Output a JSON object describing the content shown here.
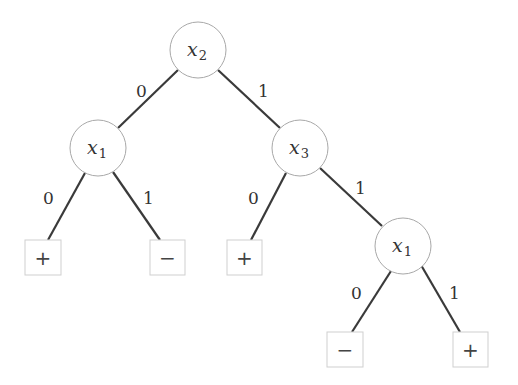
{
  "diagram": {
    "type": "binary-decision-tree",
    "nodes": [
      {
        "id": "n_root",
        "var": "x",
        "sub": "2",
        "cx": 198,
        "cy": 50
      },
      {
        "id": "n_left",
        "var": "x",
        "sub": "1",
        "cx": 98,
        "cy": 148
      },
      {
        "id": "n_right",
        "var": "x",
        "sub": "3",
        "cx": 300,
        "cy": 148
      },
      {
        "id": "n_rr",
        "var": "x",
        "sub": "1",
        "cx": 403,
        "cy": 246
      }
    ],
    "leaves": [
      {
        "id": "leaf1",
        "label": "+",
        "x": 25,
        "y": 240
      },
      {
        "id": "leaf2",
        "label": "−",
        "x": 150,
        "y": 240
      },
      {
        "id": "leaf3",
        "label": "+",
        "x": 227,
        "y": 240
      },
      {
        "id": "leaf4",
        "label": "−",
        "x": 327,
        "y": 332
      },
      {
        "id": "leaf5",
        "label": "+",
        "x": 453,
        "y": 332
      }
    ],
    "edges": [
      {
        "from": "n_root",
        "to": "n_left",
        "label": "0"
      },
      {
        "from": "n_root",
        "to": "n_right",
        "label": "1"
      },
      {
        "from": "n_left",
        "to": "leaf1",
        "label": "0"
      },
      {
        "from": "n_left",
        "to": "leaf2",
        "label": "1"
      },
      {
        "from": "n_right",
        "to": "leaf3",
        "label": "0"
      },
      {
        "from": "n_right",
        "to": "n_rr",
        "label": "1"
      },
      {
        "from": "n_rr",
        "to": "leaf4",
        "label": "0"
      },
      {
        "from": "n_rr",
        "to": "leaf5",
        "label": "1"
      }
    ]
  }
}
